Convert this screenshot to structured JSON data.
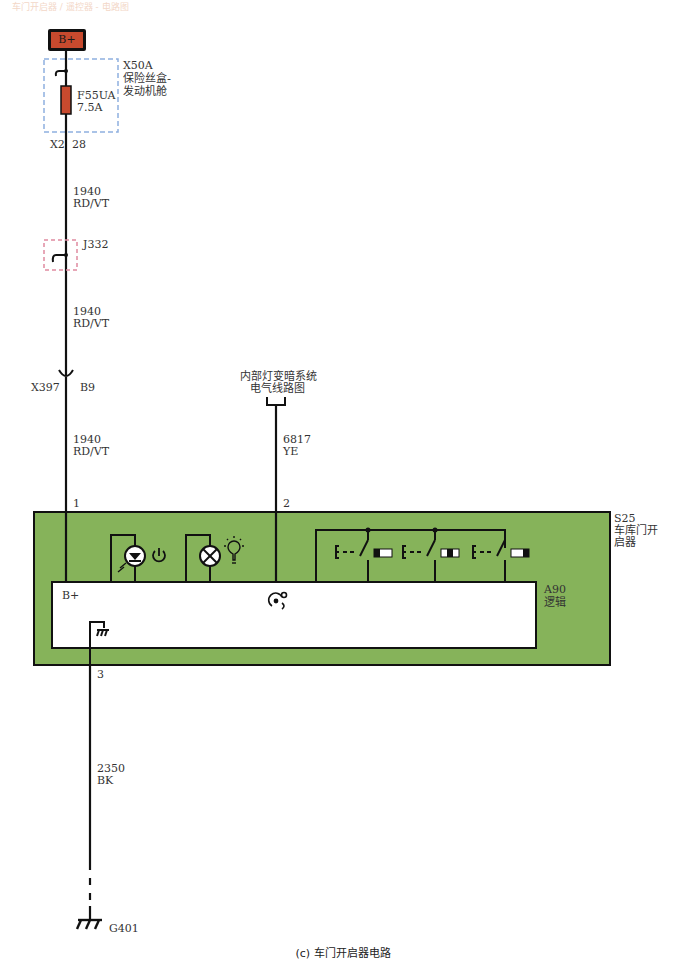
{
  "header": {
    "faint_title": "车门开启器 / 遥控器 - 电路图"
  },
  "power": {
    "label": "B+",
    "color": "#c84a2e"
  },
  "fuse_box": {
    "id": "X50A",
    "name_line1": "保险丝盒-",
    "name_line2": "发动机舱",
    "fuse_id": "F55UA",
    "fuse_rating": "7.5A",
    "connector": "X2",
    "pin": "28",
    "border_color": "#8fb0e0"
  },
  "wires": {
    "w1_seg1": {
      "circuit": "1940",
      "color": "RD/VT"
    },
    "w1_seg2": {
      "circuit": "1940",
      "color": "RD/VT"
    },
    "w1_seg3": {
      "circuit": "1940",
      "color": "RD/VT"
    },
    "w2": {
      "circuit": "6817",
      "color": "YE"
    },
    "w3": {
      "circuit": "2350",
      "color": "BK"
    }
  },
  "splice": {
    "id": "J332",
    "border_color": "#e08aa0"
  },
  "inline_connector": {
    "id": "X397",
    "pin": "B9"
  },
  "reference": {
    "line1": "内部灯变暗系统",
    "line2": "电气线路图"
  },
  "module": {
    "id": "S25",
    "name_line1": "车库门开",
    "name_line2": "启器",
    "fill_color": "#86b35a",
    "pin1": "1",
    "pin2": "2",
    "pin3": "3",
    "logic": {
      "id": "A90",
      "name": "逻辑",
      "bplus_label": "B+"
    }
  },
  "ground": {
    "id": "G401"
  },
  "caption": "(c) 车门开启器电路"
}
